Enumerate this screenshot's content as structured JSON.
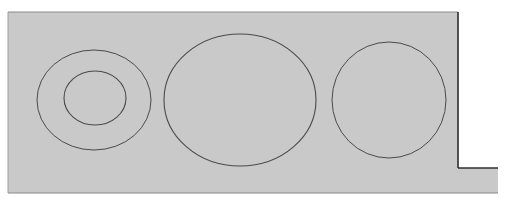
{
  "diagram": {
    "colors": {
      "background": "#ffffff",
      "panel_fill": "#c9c9c9",
      "stroke": "#4a4a4a",
      "edge": "#2e2e2e"
    },
    "panel": {
      "points": "8,12 458,12 458,168 498,168 498,193 8,193"
    },
    "shapes": [
      {
        "name": "left-outer-ring",
        "cx": 94,
        "cy": 100,
        "rx": 57,
        "ry": 50
      },
      {
        "name": "left-inner-ring",
        "cx": 95,
        "cy": 98,
        "rx": 31,
        "ry": 27
      },
      {
        "name": "center-ellipse",
        "cx": 240,
        "cy": 100,
        "rx": 76,
        "ry": 66
      },
      {
        "name": "right-circle",
        "cx": 389,
        "cy": 100,
        "rx": 57,
        "ry": 58
      }
    ]
  }
}
